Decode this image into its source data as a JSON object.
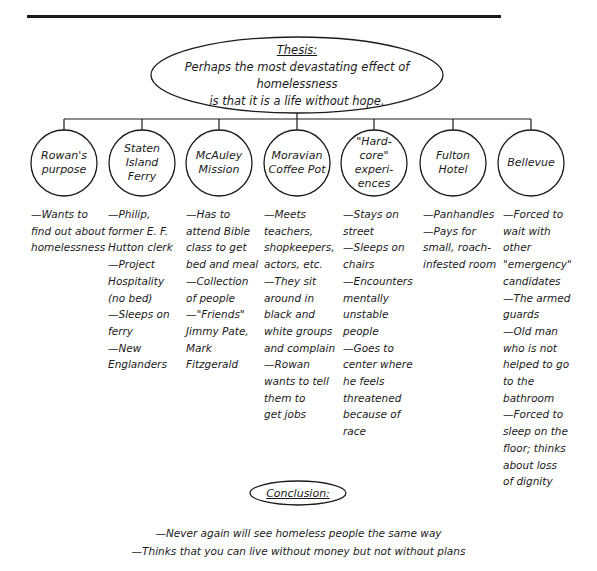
{
  "diagram": {
    "thesis": {
      "heading": "Thesis:",
      "text_line1": "Perhaps the most devastating effect of homelessness",
      "text_line2": "is that it is a life without hope."
    },
    "nodes": [
      {
        "label": "Rowan's purpose",
        "details": "—Wants to\nfind out about\nhomelessness"
      },
      {
        "label": "Staten Island Ferry",
        "details": "—Philip,\nformer E. F.\nHutton clerk\n—Project\nHospitality\n(no bed)\n—Sleeps on\nferry\n—New\nEnglanders"
      },
      {
        "label": "McAuley Mission",
        "details": "—Has to\nattend Bible\nclass to get\nbed and meal\n—Collection\nof people\n—\"Friends\"\nJimmy Pate,\nMark\nFitzgerald"
      },
      {
        "label": "Moravian Coffee Pot",
        "details": "—Meets\nteachers,\nshopkeepers,\nactors, etc.\n—They sit\naround in\nblack and\nwhite groups\nand complain\n—Rowan\nwants to tell\nthem to\nget jobs"
      },
      {
        "label": "\"Hard-core\" experi-ences",
        "details": "—Stays on\nstreet\n—Sleeps on\nchairs\n—Encounters\nmentally\nunstable people\n—Goes to\ncenter where\nhe feels\nthreatened\nbecause of race"
      },
      {
        "label": "Fulton Hotel",
        "details": "—Panhandles\n—Pays for\nsmall, roach-\ninfested room"
      },
      {
        "label": "Bellevue",
        "details": "—Forced to\nwait with\nother\n\"emergency\"\ncandidates\n—The armed\nguards\n—Old man\nwho is not\nhelped to go\nto the\nbathroom\n—Forced to\nsleep on the\nfloor; thinks\nabout loss\nof dignity"
      }
    ],
    "conclusion": {
      "heading": "Conclusion:",
      "points": [
        "—Never again will see homeless people the same way",
        "—Thinks that you can live without money but not without plans"
      ]
    }
  }
}
